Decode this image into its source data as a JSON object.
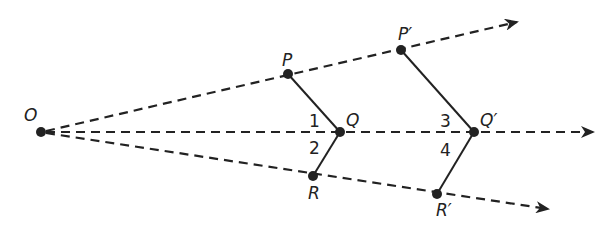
{
  "diagram": {
    "type": "dilation",
    "colors": {
      "ink": "#222222",
      "background": "#ffffff"
    },
    "center": {
      "label": "O",
      "x": 41,
      "y": 132
    },
    "rays": [
      {
        "name": "ray-OP",
        "tip_x": 517,
        "tip_y": 22
      },
      {
        "name": "ray-OQ",
        "tip_x": 593,
        "tip_y": 132
      },
      {
        "name": "ray-OR",
        "tip_x": 548,
        "tip_y": 209
      }
    ],
    "points": {
      "P": {
        "label": "P",
        "x": 288,
        "y": 74
      },
      "Q": {
        "label": "Q",
        "x": 340,
        "y": 132
      },
      "R": {
        "label": "R",
        "x": 313,
        "y": 176
      },
      "P2": {
        "label": "P′",
        "x": 401,
        "y": 50
      },
      "Q2": {
        "label": "Q′",
        "x": 474,
        "y": 132
      },
      "R2": {
        "label": "R′",
        "x": 437,
        "y": 194
      }
    },
    "angle_labels": {
      "a1": "1",
      "a2": "2",
      "a3": "3",
      "a4": "4"
    }
  }
}
